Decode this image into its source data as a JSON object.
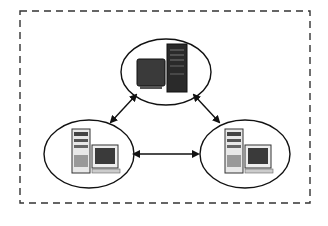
{
  "diagram": {
    "type": "network-topology",
    "boundary": {
      "style": "dashed",
      "color": "#333333"
    },
    "nodes": [
      {
        "id": "top",
        "kind": "server-workstation",
        "label": ""
      },
      {
        "id": "bottom-left",
        "kind": "desktop-computer",
        "label": ""
      },
      {
        "id": "bottom-right",
        "kind": "desktop-computer",
        "label": ""
      }
    ],
    "edges": [
      {
        "from": "top",
        "to": "bottom-left",
        "direction": "bidirectional"
      },
      {
        "from": "top",
        "to": "bottom-right",
        "direction": "bidirectional"
      },
      {
        "from": "bottom-left",
        "to": "bottom-right",
        "direction": "bidirectional"
      }
    ],
    "colors": {
      "line": "#111111",
      "screen": "#3a3a3a",
      "case_light": "#e8e8e8",
      "case_dark": "#2a2a2a"
    }
  }
}
